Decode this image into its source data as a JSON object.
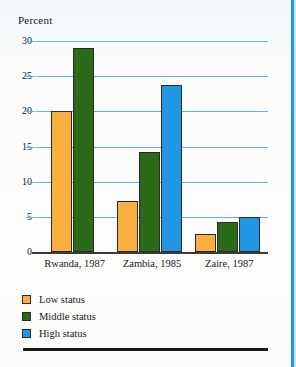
{
  "chart_data": {
    "type": "bar",
    "title": "",
    "subtitle": "",
    "xlabel": "",
    "ylabel": "Percent",
    "ylim": [
      0,
      30
    ],
    "yticks": [
      0,
      5,
      10,
      15,
      20,
      25,
      30
    ],
    "ytick_labels": [
      "0",
      "5",
      "10",
      "15",
      "20",
      "25",
      "30"
    ],
    "grid": true,
    "legend_position": "below-axis-left",
    "categories": [
      "Rwanda, 1987",
      "Zambia, 1985",
      "Zaire, 1987"
    ],
    "series": [
      {
        "name": "Low status",
        "color": "#f9b040",
        "values": [
          20.0,
          7.3,
          2.5
        ]
      },
      {
        "name": "Middle status",
        "color": "#2b6a18",
        "values": [
          29.0,
          14.2,
          4.3
        ]
      },
      {
        "name": "High status",
        "color": "#2196e3",
        "values": [
          null,
          23.7,
          5.0
        ]
      }
    ]
  },
  "axis": {
    "y_title": "Percent"
  },
  "legend": {
    "items": [
      {
        "label": "Low status",
        "swatch": "low"
      },
      {
        "label": "Middle status",
        "swatch": "middle"
      },
      {
        "label": "High status",
        "swatch": "high"
      }
    ]
  },
  "caption": {
    "text": ""
  },
  "colors": {
    "low_status": "#f9b040",
    "middle_status": "#2b6a18",
    "high_status": "#2196e3",
    "gridline": "#5cb3e8",
    "axis": "#3a3a3a",
    "page_edge": "#2196e3"
  }
}
